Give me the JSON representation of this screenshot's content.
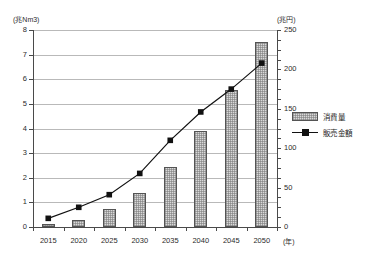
{
  "chart_data": {
    "type": "bar",
    "title": "",
    "subtitle": "",
    "xlabel": "(年)",
    "ylabel": "(兆Nm3)",
    "y2label": "(兆円)",
    "categories": [
      "2015",
      "2020",
      "2025",
      "2030",
      "2035",
      "2040",
      "2045",
      "2050"
    ],
    "grid": true,
    "legend_position": "right",
    "ylim": [
      0,
      8
    ],
    "y2lim": [
      0,
      250
    ],
    "yticks": [
      "0",
      "1",
      "2",
      "3",
      "4",
      "5",
      "6",
      "7",
      "8"
    ],
    "y2ticks": [
      "0",
      "50",
      "100",
      "150",
      "200",
      "250"
    ],
    "series": [
      {
        "name": "消費量",
        "type": "bar",
        "axis": "left",
        "unit": "兆Nm3",
        "values": [
          0.13,
          0.3,
          0.73,
          1.4,
          2.45,
          3.88,
          5.55,
          7.53
        ]
      },
      {
        "name": "販売金額",
        "type": "line",
        "axis": "right",
        "unit": "兆円",
        "values": [
          11,
          25,
          41,
          68,
          110,
          146,
          175,
          208
        ]
      }
    ]
  },
  "axes": {
    "left_unit": "(兆Nm3)",
    "right_unit": "(兆円)",
    "x_unit": "(年)"
  },
  "legend": {
    "items": [
      {
        "label": "消費量",
        "marker": "bar-swatch-icon"
      },
      {
        "label": "販売金額",
        "marker": "line-marker-icon"
      }
    ]
  }
}
